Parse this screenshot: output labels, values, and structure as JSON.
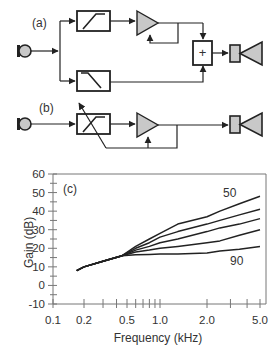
{
  "panels": {
    "a": {
      "label": "(a)"
    },
    "b": {
      "label": "(b)"
    },
    "c": {
      "label": "(c)"
    }
  },
  "blocks": {
    "a": [
      "microphone",
      "high-pass-filter",
      "amplifier-with-feedback",
      "low-pass-filter",
      "summing-junction",
      "speaker"
    ],
    "b": [
      "microphone",
      "adjustable-filter",
      "amplifier-with-feedback",
      "speaker"
    ]
  },
  "sum_symbol": "+",
  "colors": {
    "line": "#222222",
    "fill_gray": "#c8c8c8",
    "axis": "#555555"
  },
  "chart_data": {
    "type": "line",
    "title": "",
    "panel_label": "(c)",
    "xlabel": "Frequency (kHz)",
    "ylabel": "Gain (dB)",
    "xscale": "log",
    "xlim": [
      0.1,
      5.0
    ],
    "ylim": [
      -10,
      60
    ],
    "xticks": [
      "0.1",
      "0.2",
      "0.5",
      "1.0",
      "2.0",
      "5.0"
    ],
    "yticks": [
      "60",
      "50",
      "40",
      "30",
      "20",
      "10",
      "0",
      "-10"
    ],
    "grid": false,
    "annotations": [
      {
        "text": "50",
        "near_series": "50"
      },
      {
        "text": "90",
        "near_series": "90"
      }
    ],
    "series": [
      {
        "name": "50",
        "x": [
          0.17,
          0.2,
          0.3,
          0.45,
          0.6,
          0.8,
          1.0,
          1.3,
          2.0,
          2.5,
          3.5,
          5.0
        ],
        "values": [
          8,
          10,
          13,
          16,
          21,
          25,
          28,
          33,
          37,
          40,
          44,
          48
        ]
      },
      {
        "name": "60",
        "x": [
          0.17,
          0.2,
          0.3,
          0.45,
          0.6,
          0.8,
          1.0,
          1.3,
          2.0,
          2.5,
          3.5,
          5.0
        ],
        "values": [
          8,
          10,
          13,
          16,
          20,
          23,
          26,
          29,
          33,
          35,
          38,
          41
        ]
      },
      {
        "name": "70",
        "x": [
          0.17,
          0.2,
          0.3,
          0.45,
          0.6,
          0.8,
          1.0,
          1.3,
          2.0,
          2.5,
          3.5,
          5.0
        ],
        "values": [
          8,
          10,
          13,
          16,
          19,
          21,
          23,
          25,
          29,
          31,
          33,
          36
        ]
      },
      {
        "name": "80",
        "x": [
          0.17,
          0.2,
          0.3,
          0.45,
          0.6,
          0.8,
          1.0,
          1.3,
          2.0,
          2.5,
          3.5,
          5.0
        ],
        "values": [
          8,
          10,
          13,
          16,
          18,
          19,
          20,
          21,
          23,
          24,
          27,
          30
        ]
      },
      {
        "name": "90",
        "x": [
          0.17,
          0.2,
          0.3,
          0.45,
          0.6,
          0.8,
          1.0,
          1.3,
          2.0,
          2.5,
          3.5,
          5.0
        ],
        "values": [
          8,
          10,
          13,
          16,
          16.5,
          16.7,
          17,
          17,
          17.5,
          18.5,
          19.5,
          21
        ]
      }
    ]
  }
}
